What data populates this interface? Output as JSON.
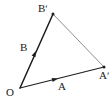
{
  "figure": {
    "width": 112,
    "height": 104,
    "background_color": "#ffffff",
    "stroke_color_dark": "#1d1d1d",
    "stroke_color_light": "#8c8c8c",
    "label_color": "#1a1a1a"
  },
  "labels": {
    "origin": "O",
    "vector_a": "A",
    "vector_b": "B",
    "point_a_prime": "Aʹ",
    "point_b_prime": "Bʹ"
  },
  "label_positions": {
    "origin": {
      "x": 6,
      "y": 87
    },
    "vector_a": {
      "x": 58,
      "y": 81
    },
    "vector_b": {
      "x": 20,
      "y": 42
    },
    "point_a_prime": {
      "x": 99,
      "y": 70
    },
    "point_b_prime": {
      "x": 38,
      "y": 3
    }
  },
  "geometry": {
    "points": {
      "O": {
        "x": 20,
        "y": 88
      },
      "A_prime": {
        "x": 104,
        "y": 67
      },
      "B_prime": {
        "x": 53,
        "y": 14
      }
    },
    "edges": [
      {
        "name": "edge-o-to-a-prime",
        "from": "O",
        "to": "A_prime",
        "stroke": "#1d1d1d",
        "width": 1.1,
        "has_mid_arrow": true,
        "arrow_at": {
          "x": 58,
          "y": 78.5
        }
      },
      {
        "name": "edge-o-to-b-prime",
        "from": "O",
        "to": "B_prime",
        "stroke": "#1d1d1d",
        "width": 1.5,
        "has_mid_arrow": true,
        "arrow_at": {
          "x": 36,
          "y": 51
        }
      },
      {
        "name": "edge-b-prime-to-a-prime",
        "from": "B_prime",
        "to": "A_prime",
        "stroke": "#8f8f8f",
        "width": 1.0,
        "has_mid_arrow": false
      }
    ],
    "vertex_dots": [
      {
        "name": "dot-b-prime",
        "x": 53,
        "y": 14,
        "r": 1.5
      },
      {
        "name": "dot-a-prime",
        "x": 104,
        "y": 67,
        "r": 1.5
      }
    ]
  }
}
